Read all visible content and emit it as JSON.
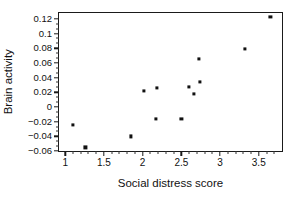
{
  "chart_data": {
    "type": "scatter",
    "title": "",
    "xlabel": "Social distress score",
    "ylabel": "Brain activity",
    "xlim": [
      0.92,
      3.8
    ],
    "ylim": [
      -0.06,
      0.128
    ],
    "grid": false,
    "legend": null,
    "marker_color": "#111111",
    "frame_color": "#1a1a1a",
    "xticks": [
      1,
      1.5,
      2,
      2.5,
      3,
      3.5
    ],
    "xtick_labels": [
      "1",
      "1.5",
      "2",
      "2.5",
      "3",
      "3.5"
    ],
    "x_minor_per_interval": 4,
    "yticks": [
      0.12,
      0.1,
      0.08,
      0.06,
      0.04,
      0.02,
      0,
      -0.02,
      -0.04,
      -0.06
    ],
    "ytick_labels": [
      "0.12",
      "0.1",
      "0.08",
      "0.06",
      "0.04",
      "0.02",
      "0",
      "−0.02",
      "−0.04",
      "−0.06"
    ],
    "y_minor_per_interval": 2,
    "points": [
      {
        "x": 1.1,
        "y": -0.025
      },
      {
        "x": 1.26,
        "y": -0.055
      },
      {
        "x": 1.85,
        "y": -0.04
      },
      {
        "x": 2.02,
        "y": 0.022
      },
      {
        "x": 2.17,
        "y": -0.016
      },
      {
        "x": 2.18,
        "y": 0.026
      },
      {
        "x": 2.5,
        "y": -0.016
      },
      {
        "x": 2.6,
        "y": 0.027
      },
      {
        "x": 2.66,
        "y": 0.018
      },
      {
        "x": 2.73,
        "y": 0.065
      },
      {
        "x": 2.74,
        "y": 0.034
      },
      {
        "x": 3.32,
        "y": 0.079
      },
      {
        "x": 3.65,
        "y": 0.123
      }
    ]
  }
}
